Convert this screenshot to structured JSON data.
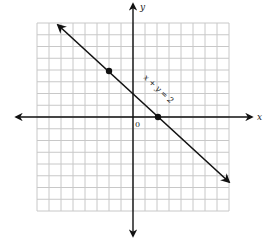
{
  "chart_data": {
    "type": "line",
    "title": "",
    "xlabel": "x",
    "ylabel": "y",
    "origin_label": "0",
    "xlim": [
      -8,
      8
    ],
    "ylim": [
      -8,
      8
    ],
    "grid": true,
    "grid_cells": 16,
    "series": [
      {
        "name": "x + y = 2",
        "equation": "x + y = 2",
        "x": [
          -6,
          -2,
          2,
          8
        ],
        "y": [
          8,
          4,
          0,
          -6
        ],
        "marked_points": [
          {
            "x": -2,
            "y": 4
          },
          {
            "x": 2,
            "y": 0
          }
        ]
      }
    ],
    "annotations": [
      {
        "text": "x + y = 2",
        "rotated_along_line": true
      }
    ]
  },
  "labels": {
    "x_axis": "x",
    "y_axis": "y",
    "origin": "0",
    "equation": "x + y = 2"
  },
  "colors": {
    "grid": "#c8c8c8",
    "axes": "#111111",
    "line": "#111111",
    "background": "#ffffff"
  }
}
